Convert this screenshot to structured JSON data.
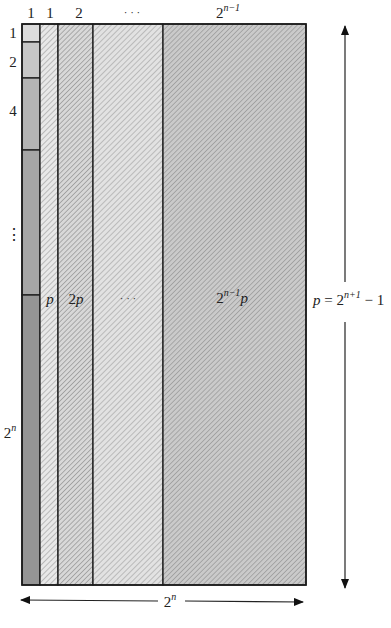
{
  "figure": {
    "colors": {
      "outline": "#1a1a1a",
      "left_block_1": "#dcdcdc",
      "left_block_2": "#c8c8c8",
      "left_block_4": "#b4b4b4",
      "left_block_dots": "#a6a6a6",
      "left_block_2n": "#969696",
      "strip_1": "#e6e6e6",
      "strip_2": "#d4d4d4",
      "strip_dots": "#dedede",
      "strip_last": "#c4c4c4",
      "hatch": "#8a8a8a"
    },
    "top_labels": {
      "left_column": "1",
      "strip_1": "1",
      "strip_2": "2",
      "strip_dots": "· · ·",
      "strip_last_base": "2",
      "strip_last_exp": "n−1"
    },
    "left_labels": {
      "block_1": "1",
      "block_2": "2",
      "block_4": "4",
      "block_dots": "⋮",
      "block_2n_base": "2",
      "block_2n_exp": "n"
    },
    "strip_labels": {
      "strip_1": "p",
      "strip_2_coef": "2",
      "strip_2_var": "p",
      "strip_dots": "· · ·",
      "strip_last_base": "2",
      "strip_last_exp": "n−1",
      "strip_last_var": "p"
    },
    "height_dimension": {
      "var": "p",
      "eq": " = 2",
      "exp": "n+1",
      "tail": " − 1"
    },
    "width_dimension": {
      "base": "2",
      "exp": "n"
    }
  }
}
